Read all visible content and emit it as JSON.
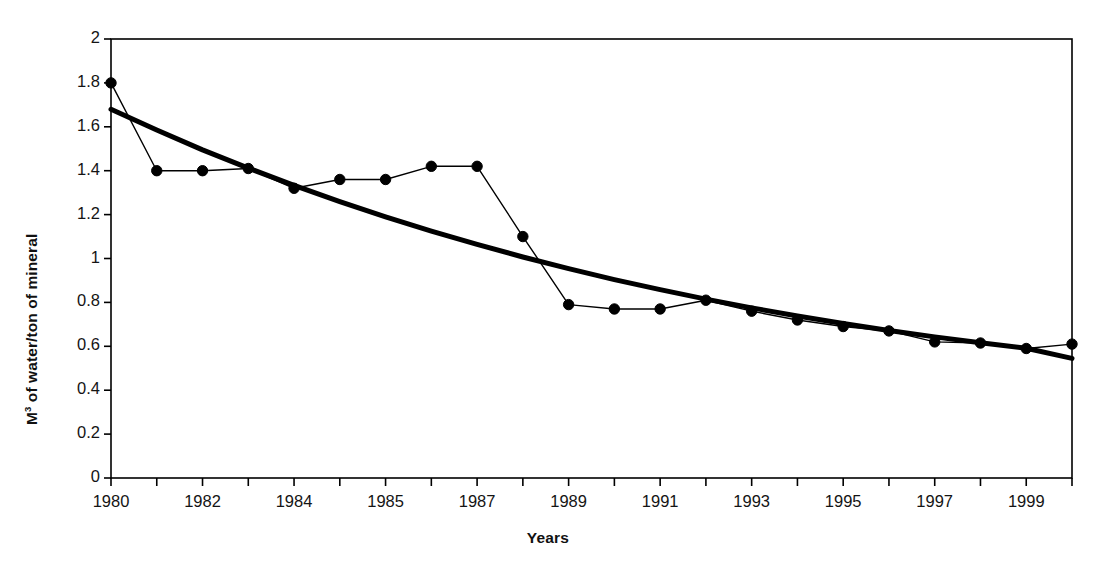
{
  "chart_data": {
    "type": "line",
    "title": "",
    "subtitle": "",
    "xlabel": "Years",
    "ylabel": "M3 of water/ton of mineral",
    "ylabel_prefix": "M",
    "ylabel_superscript": "3",
    "ylabel_suffix": " of water/ton of mineral",
    "xlim": [
      0,
      21
    ],
    "ylim": [
      0,
      2
    ],
    "grid": false,
    "legend": "none",
    "y_ticks": [
      0,
      0.2,
      0.4,
      0.6,
      0.8,
      1,
      1.2,
      1.4,
      1.6,
      1.8,
      2
    ],
    "y_tick_labels": [
      "0",
      "0.2",
      "0.4",
      "0.6",
      "0.8",
      "1",
      "1.2",
      "1.4",
      "1.6",
      "1.8",
      "2"
    ],
    "x_tick_indices": [
      0,
      1,
      2,
      3,
      4,
      5,
      6,
      7,
      8,
      9,
      10,
      11,
      12,
      13,
      14,
      15,
      16,
      17,
      18,
      19,
      20,
      21
    ],
    "x_labeled_indices": [
      0,
      2,
      4,
      6,
      8,
      10,
      12,
      14,
      16,
      18,
      20
    ],
    "x_tick_labels": [
      "1980",
      "1982",
      "1984",
      "1985",
      "1987",
      "1989",
      "1991",
      "1993",
      "1995",
      "1997",
      "1999"
    ],
    "categories": [
      0,
      1,
      2,
      3,
      4,
      5,
      6,
      7,
      8,
      9,
      10,
      11,
      12,
      13,
      14,
      15,
      16,
      17,
      18,
      19,
      20,
      21
    ],
    "series": [
      {
        "name": "M3 of water per ton of mineral",
        "style": "line-with-markers",
        "color": "#000000",
        "marker": "circle",
        "values": [
          1.8,
          1.4,
          1.4,
          1.41,
          1.32,
          1.36,
          1.36,
          1.42,
          1.42,
          1.1,
          0.79,
          0.77,
          0.77,
          0.81,
          0.76,
          0.72,
          0.69,
          0.67,
          0.62,
          0.615,
          0.59,
          0.61
        ]
      },
      {
        "name": "Trend line",
        "style": "thick-smooth-line",
        "color": "#000000",
        "marker": "none",
        "values": [
          1.68,
          1.585,
          1.495,
          1.412,
          1.333,
          1.259,
          1.19,
          1.125,
          1.064,
          1.007,
          0.954,
          0.904,
          0.858,
          0.815,
          0.775,
          0.738,
          0.704,
          0.672,
          0.643,
          0.616,
          0.591,
          0.545
        ]
      }
    ],
    "annotations": [],
    "axis_color": "#000000",
    "plot_background": "#ffffff"
  },
  "figure": {
    "caption": ""
  }
}
